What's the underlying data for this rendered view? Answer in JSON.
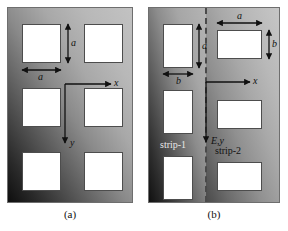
{
  "figure": {
    "panels": [
      {
        "id": "a",
        "caption": "(a)",
        "axes": {
          "x_label": "x",
          "y_label": "y"
        },
        "dimension_labels": [
          {
            "name": "height",
            "text": "a",
            "orientation": "vertical"
          },
          {
            "name": "width",
            "text": "a",
            "orientation": "horizontal"
          }
        ],
        "aperture_shape": "square",
        "aperture_count": 6,
        "aperture_rows": 3,
        "aperture_cols": 2,
        "field_gradient": {
          "dark_corner": "bottom-left",
          "light_corner": "top-right",
          "dark_hex": "#0e0e0e",
          "light_hex": "#c2c2c2"
        }
      },
      {
        "id": "b",
        "caption": "(b)",
        "axes": {
          "x_label": "x",
          "y_label": "E,y"
        },
        "dimension_labels": [
          {
            "name": "strip1-height",
            "text": "a",
            "orientation": "vertical"
          },
          {
            "name": "strip1-width",
            "text": "b",
            "orientation": "horizontal"
          },
          {
            "name": "strip2-width",
            "text": "a",
            "orientation": "horizontal"
          },
          {
            "name": "strip2-height",
            "text": "b",
            "orientation": "vertical"
          }
        ],
        "strips": [
          {
            "id": "strip-1",
            "label": "strip-1",
            "aperture_shape": "tall-rectangle",
            "field_gradient": {
              "dark_corner": "bottom-left",
              "light_corner": "top-right",
              "dark_hex": "#101010",
              "light_hex": "#b4b4b4"
            }
          },
          {
            "id": "strip-2",
            "label": "strip-2",
            "aperture_shape": "wide-rectangle",
            "field_gradient": {
              "dark_corner": "bottom-left",
              "light_corner": "top-right",
              "dark_hex": "#4a4a4a",
              "light_hex": "#c6c6c6"
            }
          }
        ],
        "divider": {
          "style": "dashed",
          "orientation": "vertical",
          "color_hex": "#4a4a4a"
        },
        "aperture_count": 6,
        "aperture_rows": 3,
        "aperture_cols": 2
      }
    ]
  }
}
